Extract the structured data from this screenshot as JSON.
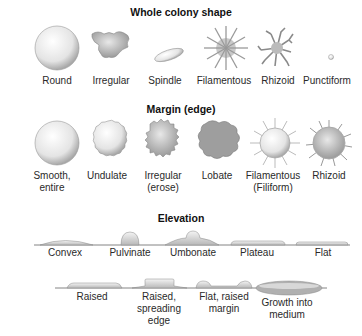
{
  "sections": [
    {
      "title": "Whole colony shape",
      "items": [
        "Round",
        "Irregular",
        "Spindle",
        "Filamentous",
        "Rhizoid",
        "Punctiform"
      ]
    },
    {
      "title": "Margin (edge)",
      "items": [
        "Smooth,\nentire",
        "Undulate",
        "Irregular\n(erose)",
        "Lobate",
        "Filamentous\n(Filiform)",
        "Rhizoid"
      ]
    },
    {
      "title": "Elevation",
      "items": [
        "Convex",
        "Pulvinate",
        "Umbonate",
        "Plateau",
        "Flat"
      ],
      "items_row2": [
        "Raised",
        "Raised,\nspreading\nedge",
        "Flat, raised\nmargin",
        "Growth into\nmedium"
      ]
    }
  ],
  "labels": {
    "shape_round": "Round",
    "shape_irregular": "Irregular",
    "shape_spindle": "Spindle",
    "shape_filamentous": "Filamentous",
    "shape_rhizoid": "Rhizoid",
    "shape_punctiform": "Punctiform",
    "margin_smooth_1": "Smooth,",
    "margin_smooth_2": "entire",
    "margin_undulate": "Undulate",
    "margin_irregular_1": "Irregular",
    "margin_irregular_2": "(erose)",
    "margin_lobate": "Lobate",
    "margin_filamentous_1": "Filamentous",
    "margin_filamentous_2": "(Filiform)",
    "margin_rhizoid": "Rhizoid",
    "elev_convex": "Convex",
    "elev_pulvinate": "Pulvinate",
    "elev_umbonate": "Umbonate",
    "elev_plateau": "Plateau",
    "elev_flat": "Flat",
    "elev_raised": "Raised",
    "elev_raised_spreading_1": "Raised,",
    "elev_raised_spreading_2": "spreading",
    "elev_raised_spreading_3": "edge",
    "elev_flat_raised_1": "Flat, raised",
    "elev_flat_raised_2": "margin",
    "elev_growth_1": "Growth into",
    "elev_growth_2": "medium"
  },
  "titles": {
    "shape": "Whole colony shape",
    "margin": "Margin (edge)",
    "elevation": "Elevation"
  }
}
